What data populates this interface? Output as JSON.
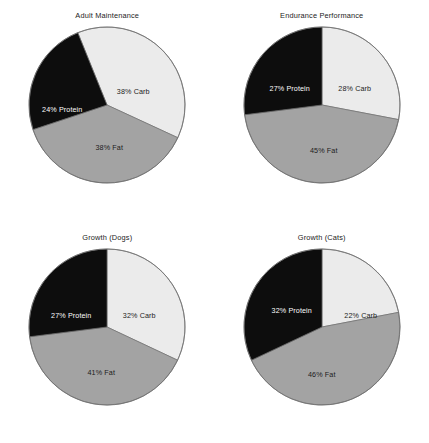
{
  "figure": {
    "background_color": "#ffffff",
    "layout": "2x2 grid of pie charts"
  },
  "palette": {
    "carb_color": "#ebebeb",
    "fat_color": "#a3a3a3",
    "protein_color": "#0d0d0d",
    "outline_color": "#6e6e6e",
    "label_dark": "#1c1c1c",
    "label_light": "#fbfbfb"
  },
  "chart_data": [
    {
      "type": "pie",
      "title": "Adult Maintenance",
      "categories": [
        "Carb",
        "Fat",
        "Protein"
      ],
      "values": [
        38,
        38,
        24
      ],
      "labels": [
        "38% Carb",
        "38% Fat",
        "24% Protein"
      ],
      "start_angle": -22,
      "colors": [
        "#ebebeb",
        "#a3a3a3",
        "#0d0d0d"
      ],
      "label_colors": [
        "#1c1c1c",
        "#1c1c1c",
        "#fbfbfb"
      ],
      "label_positions": [
        {
          "x": 106,
          "y": 66
        },
        {
          "x": 82,
          "y": 122
        },
        {
          "x": 35,
          "y": 84
        }
      ],
      "units": "percent",
      "legend": "none",
      "grid": false
    },
    {
      "type": "pie",
      "title": "Endurance Performance",
      "categories": [
        "Carb",
        "Fat",
        "Protein"
      ],
      "values": [
        28,
        45,
        27
      ],
      "labels": [
        "28% Carb",
        "45% Fat",
        "27% Protein"
      ],
      "start_angle": 0,
      "colors": [
        "#ebebeb",
        "#a3a3a3",
        "#0d0d0d"
      ],
      "label_colors": [
        "#1c1c1c",
        "#1c1c1c",
        "#fbfbfb"
      ],
      "label_positions": [
        {
          "x": 113,
          "y": 63
        },
        {
          "x": 82,
          "y": 125
        },
        {
          "x": 48,
          "y": 63
        }
      ],
      "units": "percent",
      "legend": "none",
      "grid": false
    },
    {
      "type": "pie",
      "title": "Growth (Dogs)",
      "categories": [
        "Carb",
        "Fat",
        "Protein"
      ],
      "values": [
        32,
        41,
        27
      ],
      "labels": [
        "32% Carb",
        "41% Fat",
        "27% Protein"
      ],
      "start_angle": 0,
      "colors": [
        "#ebebeb",
        "#a3a3a3",
        "#0d0d0d"
      ],
      "label_colors": [
        "#1c1c1c",
        "#1c1c1c",
        "#fbfbfb"
      ],
      "label_positions": [
        {
          "x": 112,
          "y": 68
        },
        {
          "x": 74,
          "y": 125
        },
        {
          "x": 44,
          "y": 68
        }
      ],
      "units": "percent",
      "legend": "none",
      "grid": false
    },
    {
      "type": "pie",
      "title": "Growth (Cats)",
      "categories": [
        "Carb",
        "Fat",
        "Protein"
      ],
      "values": [
        22,
        46,
        32
      ],
      "labels": [
        "22% Carb",
        "46% Fat",
        "32% Protein"
      ],
      "start_angle": 0,
      "colors": [
        "#ebebeb",
        "#a3a3a3",
        "#0d0d0d"
      ],
      "label_colors": [
        "#1c1c1c",
        "#1c1c1c",
        "#fbfbfb"
      ],
      "label_positions": [
        {
          "x": 119,
          "y": 68
        },
        {
          "x": 80,
          "y": 127
        },
        {
          "x": 50,
          "y": 63
        }
      ],
      "units": "percent",
      "legend": "none",
      "grid": false
    }
  ]
}
